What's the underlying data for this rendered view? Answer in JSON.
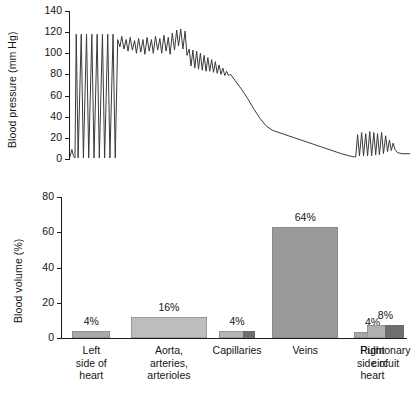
{
  "figure": {
    "title": "",
    "background": "#ffffff",
    "ink": "#1c1c1c"
  },
  "chart_data": [
    {
      "type": "line",
      "id": "blood-pressure-trace",
      "title": "",
      "xlabel": "",
      "ylabel": "Blood pressure (mm Hg)",
      "ylim": [
        0,
        140
      ],
      "yticks": [
        0,
        20,
        40,
        60,
        80,
        100,
        120,
        140
      ],
      "ytick_labels": [
        "0",
        "20",
        "40",
        "60",
        "80",
        "100",
        "120",
        "140"
      ],
      "xlim": [
        0,
        100
      ],
      "xticks": [],
      "grid": false,
      "legend": null,
      "line_color": "#3a3a3a",
      "segments": [
        {
          "name": "left ventricle",
          "x_range": [
            1,
            16
          ],
          "systolic": 118,
          "diastolic": 0,
          "description": "tall narrow spikes from 0 to ~120 mm Hg"
        },
        {
          "name": "aorta and large arteries",
          "x_range": [
            16,
            38
          ],
          "systolic": 120,
          "diastolic": 80,
          "description": "pulsatile 80-120 mm Hg plateau"
        },
        {
          "name": "arterioles",
          "x_range": [
            38,
            50
          ],
          "systolic": 95,
          "diastolic": 78,
          "description": "damped pulses falling toward 80"
        },
        {
          "name": "capillaries",
          "x_range": [
            50,
            62
          ],
          "systolic": 35,
          "diastolic": 25,
          "description": "steep non-pulsatile fall from 80 to 25"
        },
        {
          "name": "venules and veins",
          "x_range": [
            62,
            78
          ],
          "systolic": 8,
          "diastolic": 4,
          "description": "gradual decline from 25 to near 0"
        },
        {
          "name": "right heart and pulmonary circuit",
          "x_range": [
            78,
            97
          ],
          "systolic": 25,
          "diastolic": 2,
          "description": "small pulses 0-25 mm Hg, settling at ~4"
        }
      ],
      "points": [
        [
          1.0,
          2
        ],
        [
          1.6,
          9
        ],
        [
          2.1,
          3
        ],
        [
          2.6,
          1
        ],
        [
          3.0,
          118
        ],
        [
          3.6,
          1
        ],
        [
          4.6,
          118
        ],
        [
          5.3,
          1
        ],
        [
          6.3,
          118
        ],
        [
          7.0,
          1
        ],
        [
          8.0,
          118
        ],
        [
          8.7,
          1
        ],
        [
          9.7,
          118
        ],
        [
          10.4,
          1
        ],
        [
          11.4,
          118
        ],
        [
          12.1,
          1
        ],
        [
          13.1,
          118
        ],
        [
          13.8,
          1
        ],
        [
          14.8,
          118
        ],
        [
          15.5,
          1
        ],
        [
          16.3,
          113
        ],
        [
          17.0,
          106
        ],
        [
          17.6,
          116
        ],
        [
          18.3,
          104
        ],
        [
          19.0,
          113
        ],
        [
          19.6,
          102
        ],
        [
          20.3,
          115
        ],
        [
          21.0,
          103
        ],
        [
          21.7,
          112
        ],
        [
          22.3,
          100
        ],
        [
          23.0,
          114
        ],
        [
          23.7,
          101
        ],
        [
          24.4,
          113
        ],
        [
          25.0,
          99
        ],
        [
          25.7,
          115
        ],
        [
          26.4,
          102
        ],
        [
          27.1,
          113
        ],
        [
          27.7,
          100
        ],
        [
          28.4,
          116
        ],
        [
          29.1,
          103
        ],
        [
          29.8,
          114
        ],
        [
          30.4,
          100
        ],
        [
          31.1,
          117
        ],
        [
          31.8,
          102
        ],
        [
          32.5,
          115
        ],
        [
          33.1,
          99
        ],
        [
          33.8,
          119
        ],
        [
          34.5,
          103
        ],
        [
          35.2,
          122
        ],
        [
          35.8,
          107
        ],
        [
          36.5,
          123
        ],
        [
          37.2,
          104
        ],
        [
          37.9,
          121
        ],
        [
          38.5,
          98
        ],
        [
          39.2,
          104
        ],
        [
          39.8,
          88
        ],
        [
          40.4,
          103
        ],
        [
          41.0,
          86
        ],
        [
          41.6,
          102
        ],
        [
          42.2,
          85
        ],
        [
          42.8,
          100
        ],
        [
          43.4,
          84
        ],
        [
          44.0,
          98
        ],
        [
          44.6,
          83
        ],
        [
          45.2,
          96
        ],
        [
          45.8,
          83
        ],
        [
          46.4,
          94
        ],
        [
          47.0,
          82
        ],
        [
          47.6,
          92
        ],
        [
          48.2,
          81
        ],
        [
          48.8,
          89
        ],
        [
          49.4,
          80
        ],
        [
          50.0,
          86
        ],
        [
          50.6,
          79
        ],
        [
          51.2,
          83
        ],
        [
          51.8,
          79
        ],
        [
          52.5,
          80
        ],
        [
          54.0,
          74
        ],
        [
          56.0,
          66
        ],
        [
          58.0,
          57
        ],
        [
          60.0,
          47
        ],
        [
          62.0,
          38
        ],
        [
          64.0,
          31
        ],
        [
          66.0,
          27
        ],
        [
          68.0,
          25
        ],
        [
          70.0,
          23
        ],
        [
          73.0,
          20
        ],
        [
          76.0,
          17
        ],
        [
          79.0,
          14
        ],
        [
          82.0,
          11
        ],
        [
          85.0,
          8
        ],
        [
          88.0,
          5
        ],
        [
          90.5,
          3
        ],
        [
          92.0,
          2
        ],
        [
          92.6,
          2
        ],
        [
          93.2,
          23
        ],
        [
          93.8,
          3
        ],
        [
          94.5,
          25
        ],
        [
          95.1,
          3
        ],
        [
          95.8,
          24
        ],
        [
          96.4,
          3
        ],
        [
          97.1,
          26
        ],
        [
          97.7,
          3
        ],
        [
          98.4,
          25
        ],
        [
          99.0,
          4
        ],
        [
          99.6,
          24
        ],
        [
          100.2,
          4
        ],
        [
          100.9,
          25
        ],
        [
          101.5,
          5
        ],
        [
          102.2,
          22
        ],
        [
          102.8,
          7
        ],
        [
          103.4,
          18
        ],
        [
          104.0,
          8
        ],
        [
          104.6,
          15
        ],
        [
          105.2,
          9
        ],
        [
          106.0,
          6
        ],
        [
          107.5,
          5
        ],
        [
          110.0,
          5
        ]
      ]
    },
    {
      "type": "bar",
      "id": "blood-volume-distribution",
      "title": "",
      "xlabel": "",
      "ylabel": "Blood volume (%)",
      "ylim": [
        0,
        80
      ],
      "yticks": [
        0,
        20,
        40,
        60,
        80
      ],
      "ytick_labels": [
        "0",
        "20",
        "40",
        "60",
        "80"
      ],
      "grid": false,
      "legend": null,
      "categories": [
        {
          "lines": [
            "Left",
            "side of",
            "heart"
          ],
          "value": 4,
          "label": "4%"
        },
        {
          "lines": [
            "Aorta,",
            "arteries,",
            "arterioles"
          ],
          "value": 16,
          "label": "16%"
        },
        {
          "lines": [
            "Capillaries"
          ],
          "value": 4,
          "label": "4%"
        },
        {
          "lines": [
            "Veins"
          ],
          "value": 64,
          "label": "64%"
        },
        {
          "lines": [
            "Right",
            "side of",
            "heart"
          ],
          "value": 4,
          "label": "4%"
        },
        {
          "lines": [
            "Pulmonary",
            "circuit"
          ],
          "value": 8,
          "label": "8%"
        }
      ],
      "values": [
        4,
        16,
        4,
        64,
        4,
        8
      ],
      "value_labels": [
        "4%",
        "16%",
        "4%",
        "64%",
        "4%",
        "8%"
      ],
      "bar_colors": [
        "#a8a8a8",
        "#bdbdbd",
        "#b5b5b5",
        "#9a9a9a",
        "#a8a8a8",
        "#b0b0b0"
      ],
      "bar_accent_color": "#6e6e6e",
      "bar_edge_color": "#7a7a7a"
    }
  ],
  "bars_geometry": {
    "note": "drawn heights in axis units and horizontal placement as a fraction of the plot width",
    "items": [
      {
        "left_pct": 3.0,
        "width_pct": 11.0,
        "drawn_height": 4,
        "accent_left_pct": null,
        "accent_width_pct": 0
      },
      {
        "left_pct": 20.0,
        "width_pct": 22.0,
        "drawn_height": 12,
        "accent_left_pct": null,
        "accent_width_pct": 0
      },
      {
        "left_pct": 45.5,
        "width_pct": 10.5,
        "drawn_height": 4,
        "accent_left_pct": 7.0,
        "accent_width_pct": 3.5
      },
      {
        "left_pct": 61.0,
        "width_pct": 19.0,
        "drawn_height": 63,
        "accent_left_pct": null,
        "accent_width_pct": 0
      },
      {
        "left_pct": 84.5,
        "width_pct": 11.0,
        "drawn_height": 3.5,
        "accent_left_pct": null,
        "accent_width_pct": 0
      },
      {
        "left_pct": 88.5,
        "width_pct": 10.5,
        "drawn_height": 7.5,
        "accent_left_pct": 5.0,
        "accent_width_pct": 5.5
      }
    ]
  }
}
